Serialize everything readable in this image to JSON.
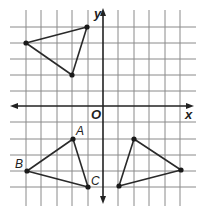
{
  "figure": {
    "type": "coordinate-grid",
    "axes": {
      "x_label": "x",
      "y_label": "y",
      "origin_label": "O"
    },
    "grid_units": {
      "x_min": -6,
      "x_max": 5,
      "y_min": -6,
      "y_max": 5
    },
    "triangles": [
      {
        "name": "top-left-triangle",
        "vertices": [
          [
            -6,
            3
          ],
          [
            -1,
            4
          ],
          [
            -2,
            1
          ]
        ],
        "labels": [
          "",
          "",
          ""
        ]
      },
      {
        "name": "triangle-ABC",
        "vertices": [
          [
            -2,
            -2
          ],
          [
            -5,
            -4
          ],
          [
            -1,
            -5
          ]
        ],
        "labels": [
          "A",
          "B",
          "C"
        ]
      },
      {
        "name": "bottom-right-triangle",
        "vertices": [
          [
            2,
            -2
          ],
          [
            5,
            -4
          ],
          [
            1,
            -5
          ]
        ],
        "labels": [
          "",
          "",
          ""
        ]
      }
    ]
  },
  "labels": {
    "x": "x",
    "y": "y",
    "origin": "O",
    "A": "A",
    "B": "B",
    "C": "C"
  },
  "colors": {
    "grid": "#8a8a8a",
    "ink": "#222222",
    "background": "#ffffff"
  }
}
